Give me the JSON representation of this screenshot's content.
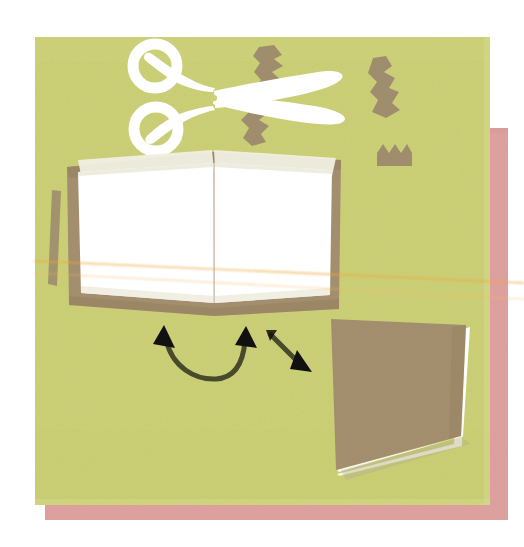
{
  "image": {
    "title": "Craft instruction illustration: cut and fold a book",
    "medium": "flat vector illustration with paper-grain texture",
    "canvas": {
      "width": 524,
      "height": 547,
      "background_color": "#ffffff"
    }
  },
  "palette": {
    "background": "#ffffff",
    "green_panel": "#ccd177",
    "green_panel_shade": "#c3c96c",
    "pink_card": "#dea2a0",
    "brown_cover": "#a4906f",
    "brown_cover_dark": "#93815f",
    "brown_scrap": "#a08f6e",
    "paper_white": "#ffffff",
    "paper_shadow": "#efeee1",
    "paper_edge": "#e8e6d6",
    "arrow_black": "#111111",
    "arrow_olive": "#4d5133",
    "thread_orange": "#f2a63c"
  },
  "layers": [
    {
      "name": "pink-card",
      "label": "Pink paper card",
      "color": "#dea2a0",
      "z": 1
    },
    {
      "name": "green-panel",
      "label": "Green paper panel",
      "color": "#ccd177",
      "z": 2
    },
    {
      "name": "brown-scraps",
      "label": "Torn brown paper scraps",
      "color": "#a08f6e",
      "z": 3
    },
    {
      "name": "scissors",
      "label": "White scissors",
      "color": "#ffffff",
      "z": 4
    },
    {
      "name": "open-book",
      "label": "Open book with blank white pages",
      "color": "#a4906f",
      "z": 5
    },
    {
      "name": "closed-book",
      "label": "Closed folded book",
      "color": "#a4906f",
      "z": 6
    },
    {
      "name": "arrows",
      "label": "Motion arrows",
      "color": "#111111",
      "z": 7
    },
    {
      "name": "threads",
      "label": "Thin orange thread lines",
      "color": "#f2a63c",
      "z": 8
    }
  ],
  "objects": {
    "pink_card": {
      "label": "Pink card",
      "x": 45,
      "y": 128,
      "width": 463,
      "height": 392
    },
    "green_panel": {
      "label": "Green panel",
      "x": 35,
      "y": 37,
      "width": 455,
      "height": 468
    },
    "scissors": {
      "label": "Scissors",
      "description": "White open scissors, two ring handles at left, blades pointing right",
      "rings": 2,
      "x": 130,
      "y": 44,
      "width": 210,
      "height": 100
    },
    "open_book": {
      "label": "Open book",
      "description": "Book opened flat, brown cover, two blank white pages meeting at a central spine",
      "pages": 2,
      "x": 66,
      "y": 152,
      "width": 275,
      "height": 164
    },
    "closed_book": {
      "label": "Closed book",
      "description": "Finished folded book seen from the front, brown cover with white page edges at bottom right",
      "x": 330,
      "y": 316,
      "width": 150,
      "height": 168
    },
    "curved_arrow": {
      "label": "Double-headed curved arrow",
      "description": "U shaped arrow with arrowheads at both ends pointing up, showing the pages folding together",
      "heads": 2
    },
    "straight_arrow": {
      "label": "Diagonal arrow",
      "description": "Straight arrow pointing down and to the right toward the finished book",
      "heads": 1
    },
    "brown_scraps": {
      "label": "Torn paper scraps",
      "count": 4,
      "description": "Jagged brown offcuts scattered around the scissors"
    },
    "crown_scrap": {
      "label": "Zigzag cut strip",
      "peaks": 3,
      "x": 377,
      "y": 144,
      "width": 35,
      "height": 22
    },
    "stick": {
      "label": "Thin brown stick",
      "x": 48,
      "y": 190,
      "width": 12,
      "height": 95
    },
    "threads": {
      "label": "Orange thread lines",
      "count": 2
    }
  },
  "accessibility": {
    "alt_text": "A flat illustration on a yellow-green paper panel over a pink card: white scissors with torn brown paper scraps at the top, an open book with blank white pages in the middle, two arrows pointing toward a finished closed book at the lower right."
  }
}
